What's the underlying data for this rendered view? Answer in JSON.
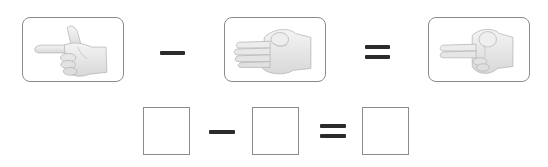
{
  "problem": {
    "title": "Finger subtraction",
    "row1": {
      "cards": [
        {
          "name": "hand-two-fingers",
          "alt": "Hand showing 2 fingers (thumb and index)",
          "fingers": 2
        },
        {
          "name": "hand-four-fingers",
          "alt": "Hand showing 4 fingers",
          "fingers": 4
        },
        {
          "name": "hand-two-fingers-result",
          "alt": "Hand showing 2 fingers (index and middle)",
          "fingers": 2
        }
      ],
      "operator": "−",
      "equals": "="
    },
    "row2": {
      "boxes": [
        {
          "name": "answer-box-minuend",
          "value": ""
        },
        {
          "name": "answer-box-subtrahend",
          "value": ""
        },
        {
          "name": "answer-box-difference",
          "value": ""
        }
      ],
      "operator": "−",
      "equals": "="
    }
  },
  "colors": {
    "card_border": "#8a8a8a",
    "operator": "#2b2b2b",
    "hand_fill": "#ececec",
    "hand_shade": "#cfcfcf",
    "hand_outline": "#b5b5b5"
  }
}
